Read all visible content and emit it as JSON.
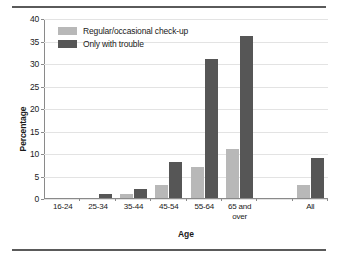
{
  "chart_data": {
    "type": "bar",
    "title": "",
    "xlabel": "Age",
    "ylabel": "Percentage",
    "ylim": [
      0,
      40
    ],
    "ytick_step": 5,
    "yticks": [
      0,
      5,
      10,
      15,
      20,
      25,
      30,
      35,
      40
    ],
    "grid": true,
    "legend_position": "top-left",
    "categories": [
      "16-24",
      "25-34",
      "35-44",
      "45-54",
      "55-64",
      "65 and over",
      "",
      "All"
    ],
    "series": [
      {
        "name": "Regular/occasional check-up",
        "color": "#b8b8b8",
        "values": [
          0,
          0,
          1,
          3,
          7,
          11,
          null,
          3
        ]
      },
      {
        "name": "Only with trouble",
        "color": "#565656",
        "values": [
          0,
          1,
          2,
          8,
          31,
          36,
          null,
          9
        ]
      }
    ]
  },
  "legend": {
    "items": [
      {
        "label": "Regular/occasional check-up",
        "color": "#b8b8b8"
      },
      {
        "label": "Only with trouble",
        "color": "#565656"
      }
    ]
  },
  "axes": {
    "y_title": "Percentage",
    "x_title": "Age",
    "y_ticks": [
      "40",
      "35",
      "30",
      "25",
      "20",
      "15",
      "10",
      "5",
      "0"
    ],
    "x_ticks": [
      "16-24",
      "25-34",
      "35-44",
      "45-54",
      "55-64",
      "65 and over",
      "",
      "All"
    ]
  },
  "colors": {
    "series_light": "#b8b8b8",
    "series_dark": "#565656",
    "gridline": "#e3e3e3",
    "axis": "#8a8a8a",
    "rule": "#5a5a5a"
  }
}
